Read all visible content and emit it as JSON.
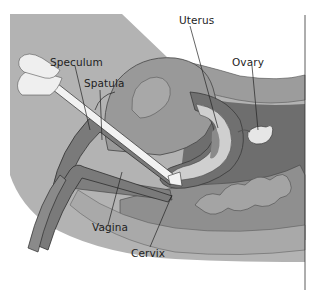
{
  "figure": {
    "type": "anatomical cross-section",
    "labels": {
      "speculum": "Speculum",
      "spatula": "Spatula",
      "uterus": "Uterus",
      "ovary": "Ovary",
      "vagina": "Vagina",
      "cervix": "Cervix"
    },
    "colors": {
      "background": "#ffffff",
      "body_outer": "#b4b4b4",
      "body_mid": "#a3a3a3",
      "abdominal_wall": "#9a9a9a",
      "pelvic_dark": "#6e6e6e",
      "uterus_wall": "#8c8c8c",
      "uterus_inner": "#cfcfcf",
      "bladder": "#a8a8a8",
      "speculum": "#7a7a7a",
      "spatula": "#f2f2f2",
      "hand": "#efefef",
      "outline": "#3a3a3a"
    }
  }
}
